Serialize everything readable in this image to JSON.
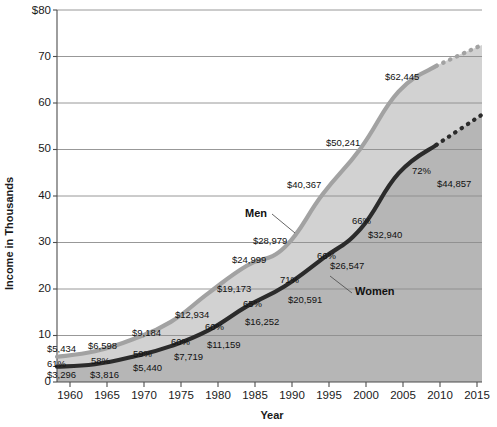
{
  "chart_data": {
    "type": "line",
    "title": "",
    "xlabel": "Year",
    "ylabel": "Income in Thousands",
    "xlim": [
      1960,
      2016
    ],
    "ylim": [
      0,
      80
    ],
    "xticks": [
      "1960",
      "1965",
      "1970",
      "1975",
      "1980",
      "1985",
      "1990",
      "1995",
      "2000",
      "2005",
      "2010",
      "2015"
    ],
    "xtick_values": [
      1960,
      1965,
      1970,
      1975,
      1980,
      1985,
      1990,
      1995,
      2000,
      2005,
      2010,
      2015
    ],
    "yticks": [
      "0",
      "10",
      "20",
      "30",
      "40",
      "50",
      "60",
      "70",
      "$80"
    ],
    "ytick_values": [
      0,
      10,
      20,
      30,
      40,
      50,
      60,
      70,
      80
    ],
    "grid": "horizontal",
    "legend": "inline-annotations",
    "x": [
      1960,
      1965,
      1970,
      1975,
      1980,
      1985,
      1990,
      1995,
      2000,
      2005,
      2010,
      2016
    ],
    "series": [
      {
        "name": "Men",
        "color": "#a2a2a2",
        "values": [
          5434,
          6598,
          9184,
          12934,
          19173,
          24999,
          28979,
          40367,
          50241,
          62445,
          68000,
          72500
        ],
        "labels": [
          "$5,434",
          "$6,598",
          "$9,184",
          "$12,934",
          "$19,173",
          "$24,999",
          "$28,979",
          "$40,367",
          "$50,241",
          "$62,445",
          "",
          ""
        ],
        "projected_from": 2010
      },
      {
        "name": "Women",
        "color": "#2b2b2b",
        "values": [
          3296,
          3816,
          5440,
          7719,
          11159,
          16252,
          20591,
          26547,
          32940,
          44857,
          51000,
          57500
        ],
        "labels": [
          "$3,296",
          "$3,816",
          "$5,440",
          "$7,719",
          "$11,159",
          "$16,252",
          "$20,591",
          "$26,547",
          "$32,940",
          "$44,857",
          "",
          ""
        ],
        "ratio_labels": [
          "61%",
          "58%",
          "59%",
          "60%",
          "60%",
          "65%",
          "71%",
          "66%",
          "66%",
          "72%",
          "",
          ""
        ],
        "projected_from": 2010
      }
    ],
    "annotations": [
      {
        "text": "Men",
        "x": 1986.0,
        "y": 34.0
      },
      {
        "text": "Women",
        "x": 1999.5,
        "y": 21.5
      }
    ],
    "colors": {
      "men_line": "#a2a2a2",
      "women_line": "#2b2b2b",
      "fill_between": "#d2d2d2",
      "fill_under_women": "#b6b6b6",
      "gridline": "#8c8c8c",
      "axis": "#4d4d4d",
      "text": "#111111"
    }
  },
  "dollar_labels": [
    {
      "text": "$5,434",
      "x": 47,
      "y": 352
    },
    {
      "text": "$6,598",
      "x": 88,
      "y": 349
    },
    {
      "text": "$9,184",
      "x": 132,
      "y": 336
    },
    {
      "text": "$12,934",
      "x": 175,
      "y": 318
    },
    {
      "text": "$19,173",
      "x": 217,
      "y": 292
    },
    {
      "text": "$24,999",
      "x": 232,
      "y": 263
    },
    {
      "text": "$28,979",
      "x": 253,
      "y": 244
    },
    {
      "text": "$40,367",
      "x": 287,
      "y": 188
    },
    {
      "text": "$50,241",
      "x": 326,
      "y": 146
    },
    {
      "text": "$62,445",
      "x": 385,
      "y": 80
    }
  ],
  "women_dollar_labels": [
    {
      "text": "$3,296",
      "x": 47,
      "y": 378
    },
    {
      "text": "$3,816",
      "x": 90,
      "y": 378
    },
    {
      "text": "$5,440",
      "x": 133,
      "y": 371
    },
    {
      "text": "$7,719",
      "x": 174,
      "y": 360
    },
    {
      "text": "$11,159",
      "x": 207,
      "y": 348
    },
    {
      "text": "$16,252",
      "x": 245,
      "y": 325
    },
    {
      "text": "$20,591",
      "x": 288,
      "y": 303
    },
    {
      "text": "$26,547",
      "x": 330,
      "y": 269
    },
    {
      "text": "$32,940",
      "x": 368,
      "y": 238
    },
    {
      "text": "$44,857",
      "x": 437,
      "y": 187
    }
  ],
  "pct_labels": [
    {
      "text": "61%",
      "x": 47,
      "y": 367
    },
    {
      "text": "58%",
      "x": 91,
      "y": 364
    },
    {
      "text": "59%",
      "x": 133,
      "y": 357
    },
    {
      "text": "60%",
      "x": 171,
      "y": 345
    },
    {
      "text": "60%",
      "x": 205,
      "y": 330
    },
    {
      "text": "65%",
      "x": 243,
      "y": 307
    },
    {
      "text": "71%",
      "x": 280,
      "y": 283
    },
    {
      "text": "66%",
      "x": 317,
      "y": 259
    },
    {
      "text": "66%",
      "x": 352,
      "y": 224
    },
    {
      "text": "72%",
      "x": 412,
      "y": 174
    }
  ],
  "series_labels": [
    {
      "text": "Men",
      "x": 245,
      "y": 217
    },
    {
      "text": "Women",
      "x": 355,
      "y": 295
    }
  ],
  "axis_titles": {
    "y": "Income in Thousands",
    "x": "Year"
  },
  "ytick_labels": [
    {
      "text": "$80",
      "y": 10
    },
    {
      "text": "70",
      "y": 56
    },
    {
      "text": "60",
      "y": 102
    },
    {
      "text": "50",
      "y": 148
    },
    {
      "text": "40",
      "y": 195
    },
    {
      "text": "30",
      "y": 241
    },
    {
      "text": "20",
      "y": 288
    },
    {
      "text": "10",
      "y": 334
    },
    {
      "text": "0",
      "y": 381
    }
  ],
  "xtick_labels": [
    {
      "text": "1960",
      "x": 70
    },
    {
      "text": "1965",
      "x": 107
    },
    {
      "text": "1970",
      "x": 144
    },
    {
      "text": "1975",
      "x": 181
    },
    {
      "text": "1980",
      "x": 218
    },
    {
      "text": "1985",
      "x": 255
    },
    {
      "text": "1990",
      "x": 292
    },
    {
      "text": "1995",
      "x": 329
    },
    {
      "text": "2000",
      "x": 366
    },
    {
      "text": "2005",
      "x": 403
    },
    {
      "text": "2010",
      "x": 440
    },
    {
      "text": "2015",
      "x": 477
    }
  ]
}
